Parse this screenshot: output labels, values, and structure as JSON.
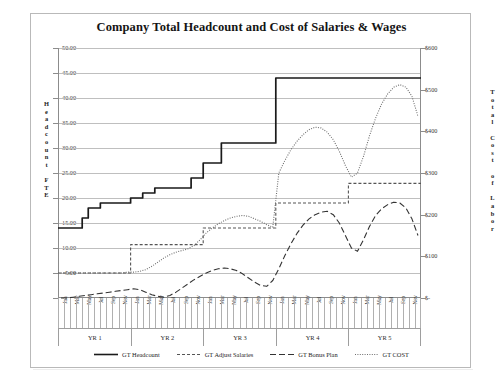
{
  "chart_card": {
    "title": "Company Total Headcount and Cost of Salaries & Wages",
    "caption": ""
  },
  "axes": {
    "left_title_chars": [
      "H",
      "e",
      "a",
      "d",
      "c",
      "o",
      "u",
      "n",
      "t",
      "",
      "F",
      "T",
      "E"
    ],
    "right_title_chars": [
      "T",
      "o",
      "t",
      "a",
      "l",
      "",
      "C",
      "o",
      "s",
      "t",
      "",
      "o",
      "f",
      "",
      "L",
      "a",
      "b",
      "o",
      "r"
    ],
    "left_ticks": [
      "50.00",
      "45.00",
      "40.00",
      "35.00",
      "30.00",
      "25.00",
      "20.00",
      "15.00",
      "10.00",
      "5.00",
      "-"
    ],
    "right_ticks": [
      "$600",
      "$500",
      "$400",
      "$300",
      "$200",
      "$100",
      "$-"
    ],
    "year_labels": [
      "YR 1",
      "YR 2",
      "YR 3",
      "YR 4",
      "YR 5"
    ],
    "month_labels": [
      "Jan",
      "",
      "Mar",
      "",
      "May",
      "",
      "Jul",
      "",
      "Sep",
      "",
      "Nov",
      ""
    ]
  },
  "legend": {
    "items": [
      {
        "label": "GT Headcount",
        "style": "solid",
        "color": "#1a1a1a",
        "icon": "line-solid-icon"
      },
      {
        "label": "GT Adjust Salaries",
        "style": "short-dash",
        "color": "#555555",
        "icon": "line-dashed-icon"
      },
      {
        "label": "GT Bonus Plan",
        "style": "long-dash",
        "color": "#333333",
        "icon": "line-longdash-icon"
      },
      {
        "label": "GT COST",
        "style": "dotted",
        "color": "#6e6e6e",
        "icon": "line-dotted-icon"
      }
    ]
  },
  "chart_data": {
    "type": "line",
    "title": "Company Total Headcount and Cost of Salaries & Wages",
    "xlabel": "",
    "ylabel": "Headcount FTE",
    "y2label": "Total Cost of Labor",
    "ylim": [
      0,
      50
    ],
    "y2lim": [
      0,
      600
    ],
    "grid": true,
    "legend_position": "bottom",
    "x": [
      "YR1-Jan",
      "YR1-Feb",
      "YR1-Mar",
      "YR1-Apr",
      "YR1-May",
      "YR1-Jun",
      "YR1-Jul",
      "YR1-Aug",
      "YR1-Sep",
      "YR1-Oct",
      "YR1-Nov",
      "YR1-Dec",
      "YR2-Jan",
      "YR2-Feb",
      "YR2-Mar",
      "YR2-Apr",
      "YR2-May",
      "YR2-Jun",
      "YR2-Jul",
      "YR2-Aug",
      "YR2-Sep",
      "YR2-Oct",
      "YR2-Nov",
      "YR2-Dec",
      "YR3-Jan",
      "YR3-Feb",
      "YR3-Mar",
      "YR3-Apr",
      "YR3-May",
      "YR3-Jun",
      "YR3-Jul",
      "YR3-Aug",
      "YR3-Sep",
      "YR3-Oct",
      "YR3-Nov",
      "YR3-Dec",
      "YR4-Jan",
      "YR4-Feb",
      "YR4-Mar",
      "YR4-Apr",
      "YR4-May",
      "YR4-Jun",
      "YR4-Jul",
      "YR4-Aug",
      "YR4-Sep",
      "YR4-Oct",
      "YR4-Nov",
      "YR4-Dec",
      "YR5-Jan",
      "YR5-Feb",
      "YR5-Mar",
      "YR5-Apr",
      "YR5-May",
      "YR5-Jun",
      "YR5-Jul",
      "YR5-Aug",
      "YR5-Sep",
      "YR5-Oct",
      "YR5-Nov",
      "YR5-Dec"
    ],
    "series": [
      {
        "name": "GT Headcount",
        "axis": "left",
        "units": "FTE",
        "style": "solid",
        "step": true,
        "values": [
          14,
          14,
          14,
          14,
          16,
          18,
          18,
          19,
          19,
          19,
          19,
          19,
          20,
          20,
          21,
          21,
          22,
          22,
          22,
          22,
          22,
          22,
          24,
          24,
          27,
          27,
          27,
          31,
          31,
          31,
          31,
          31,
          31,
          31,
          31,
          31,
          44,
          44,
          44,
          44,
          44,
          44,
          44,
          44,
          44,
          44,
          44,
          44,
          44,
          44,
          44,
          44,
          44,
          44,
          44,
          44,
          44,
          44,
          44,
          44
        ]
      },
      {
        "name": "GT Adjust Salaries",
        "axis": "right",
        "units": "$",
        "style": "short-dash",
        "step": true,
        "values": [
          60,
          60,
          60,
          60,
          60,
          60,
          60,
          60,
          60,
          60,
          60,
          60,
          128,
          128,
          128,
          128,
          128,
          128,
          128,
          128,
          128,
          128,
          128,
          128,
          168,
          168,
          168,
          168,
          168,
          168,
          168,
          168,
          168,
          168,
          168,
          168,
          228,
          228,
          228,
          228,
          228,
          228,
          228,
          228,
          228,
          228,
          228,
          228,
          275,
          275,
          275,
          275,
          275,
          275,
          275,
          275,
          275,
          275,
          275,
          275
        ]
      },
      {
        "name": "GT Bonus Plan",
        "axis": "right",
        "units": "$",
        "style": "long-dash",
        "step": false,
        "values": [
          0,
          0,
          2,
          4,
          6,
          8,
          10,
          12,
          14,
          16,
          18,
          20,
          22,
          20,
          14,
          8,
          4,
          2,
          6,
          14,
          24,
          34,
          44,
          52,
          60,
          66,
          70,
          72,
          70,
          66,
          58,
          48,
          38,
          30,
          28,
          42,
          70,
          102,
          130,
          155,
          175,
          190,
          200,
          206,
          208,
          200,
          180,
          150,
          120,
          112,
          140,
          172,
          198,
          214,
          224,
          230,
          228,
          216,
          190,
          150
        ]
      },
      {
        "name": "GT COST",
        "axis": "right",
        "units": "$",
        "style": "dotted",
        "step": false,
        "values": [
          60,
          60,
          60,
          60,
          60,
          60,
          60,
          60,
          60,
          60,
          60,
          62,
          62,
          64,
          68,
          76,
          86,
          96,
          104,
          110,
          114,
          118,
          126,
          140,
          156,
          168,
          178,
          186,
          192,
          196,
          198,
          196,
          190,
          184,
          176,
          170,
          300,
          330,
          356,
          376,
          392,
          404,
          410,
          408,
          398,
          380,
          352,
          318,
          290,
          300,
          340,
          390,
          432,
          466,
          490,
          506,
          512,
          506,
          484,
          436
        ]
      }
    ]
  }
}
